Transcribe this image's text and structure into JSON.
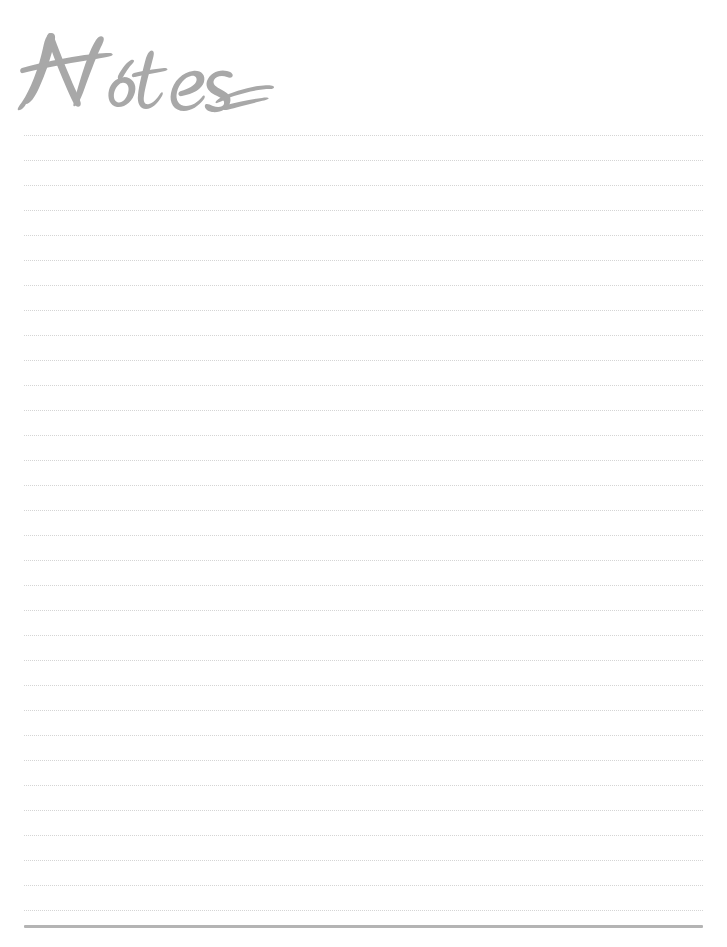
{
  "page": {
    "width": 727,
    "height": 947,
    "background_color": "#ffffff"
  },
  "title": {
    "text": "Notes",
    "style": "brush-script-handwritten",
    "color": "#a8a8a8",
    "left": 14,
    "top": 18,
    "width": 260,
    "height": 100,
    "has_flourish_tail": true
  },
  "ruled_lines": {
    "count": 32,
    "first_line_y": 135,
    "spacing": 25,
    "left": 24,
    "right": 703,
    "color": "#d5d5d5",
    "style": "dotted",
    "thickness": 1
  },
  "bottom_bar": {
    "left": 24,
    "right": 703,
    "top": 925,
    "height": 3,
    "color": "#b4b4b4"
  }
}
